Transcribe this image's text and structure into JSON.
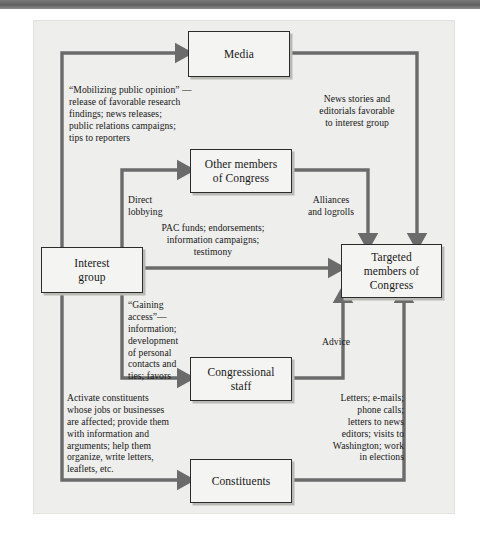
{
  "figure": {
    "background_color": "#eeeeec",
    "arrow_color": "#6b6b6b",
    "box_fill": "#f4f4f2",
    "box_border": "#2b2b2b"
  },
  "nodes": [
    {
      "id": "media",
      "label": "Media"
    },
    {
      "id": "other_members",
      "label": "Other members\nof Congress"
    },
    {
      "id": "interest",
      "label": "Interest\ngroup"
    },
    {
      "id": "targeted",
      "label": "Targeted\nmembers of\nCongress"
    },
    {
      "id": "staff",
      "label": "Congressional\nstaff"
    },
    {
      "id": "constituents",
      "label": "Constituents"
    }
  ],
  "labels": {
    "mobilizing": "“Mobilizing public opinion” —\nrelease of favorable research\nfindings; news releases;\npublic relations campaigns;\ntips to reporters",
    "news_stories": "News stories and\neditorials favorable\nto interest group",
    "direct_lobbying": "Direct\nlobbying",
    "alliances": "Alliances\nand logrolls",
    "pac_funds": "PAC funds; endorsements;\ninformation campaigns;\ntestimony",
    "gaining_access": "“Gaining access”—\ninformation;\ndevelopment\nof personal\ncontacts and\nties; favors",
    "advice": "Advice",
    "activate": "Activate constituents\nwhose jobs or businesses\nare affected; provide them\nwith information and\narguments; help them\norganize, write letters,\nleaflets, etc.",
    "letters": "Letters; e-mails;\nphone calls;\nletters to news\neditors; visits to\nWashington; work\nin elections"
  },
  "edges": [
    {
      "from": "interest",
      "to": "media",
      "label_key": "mobilizing"
    },
    {
      "from": "media",
      "to": "targeted",
      "label_key": "news_stories"
    },
    {
      "from": "interest",
      "to": "other_members",
      "label_key": "direct_lobbying"
    },
    {
      "from": "other_members",
      "to": "targeted",
      "label_key": "alliances"
    },
    {
      "from": "interest",
      "to": "targeted",
      "label_key": "pac_funds"
    },
    {
      "from": "interest",
      "to": "staff",
      "label_key": "gaining_access"
    },
    {
      "from": "staff",
      "to": "targeted",
      "label_key": "advice"
    },
    {
      "from": "interest",
      "to": "constituents",
      "label_key": "activate"
    },
    {
      "from": "constituents",
      "to": "targeted",
      "label_key": "letters"
    }
  ]
}
